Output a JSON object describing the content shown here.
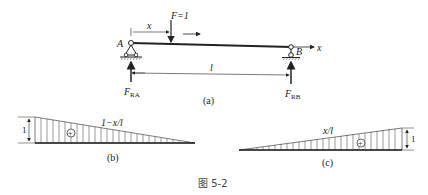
{
  "figure": {
    "caption": "图 5-2",
    "beam": {
      "label_A": "A",
      "label_B": "B",
      "load_label": "F=1",
      "dist_label": "x",
      "axis_label": "x",
      "span_label": "l",
      "reaction_A": "F",
      "reaction_A_sub": "RA",
      "reaction_B": "F",
      "reaction_B_sub": "RB",
      "sub_caption": "(a)"
    },
    "influence_A": {
      "expression": "1−x/l",
      "ordinate": "1",
      "sign": "+",
      "sub_caption": "(b)"
    },
    "influence_B": {
      "expression": "x/l",
      "ordinate": "1",
      "sign": "+",
      "sub_caption": "(c)"
    }
  }
}
